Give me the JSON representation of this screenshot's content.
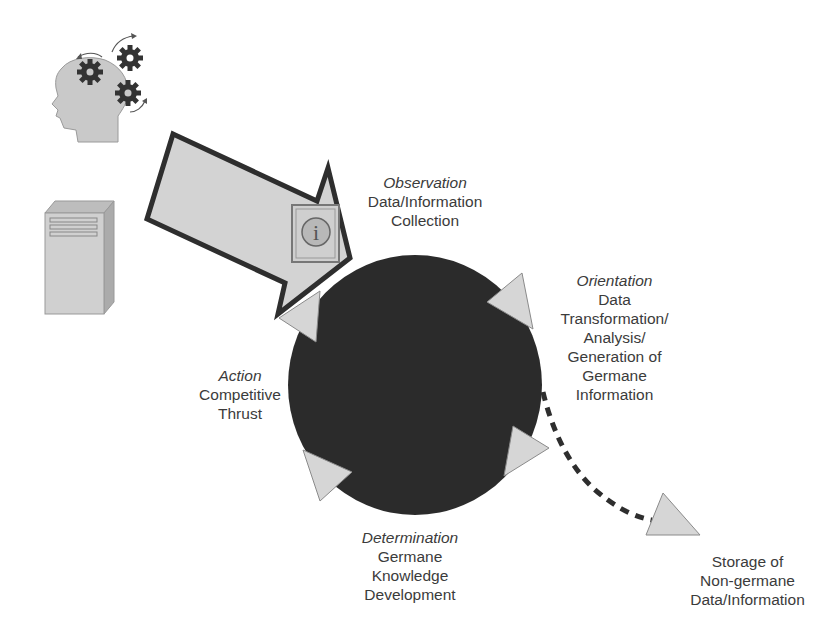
{
  "diagram": {
    "type": "OODA-style cycle: Observation → Orientation → Determination → Action",
    "inputs": [
      {
        "name": "human-knowledge",
        "icon": "head-with-gears-icon"
      },
      {
        "name": "computer-system",
        "icon": "server-tower-icon"
      }
    ],
    "input_arrow_icon": "information-icon",
    "info_glyph": "i",
    "stages": {
      "observation": {
        "title": "Observation",
        "lines": [
          "Data/Information",
          "Collection"
        ]
      },
      "orientation": {
        "title": "Orientation",
        "lines": [
          "Data",
          "Transformation/",
          "Analysis/",
          "Generation of",
          "Germane",
          "Information"
        ]
      },
      "determination": {
        "title": "Determination",
        "lines": [
          "Germane",
          "Knowledge",
          "Development"
        ]
      },
      "action": {
        "title": "Action",
        "lines": [
          "Competitive",
          "Thrust"
        ]
      }
    },
    "output": {
      "lines": [
        "Storage of",
        "Non-germane",
        "Data/Information"
      ],
      "connector": "dashed-curve"
    },
    "colors": {
      "circle": "#2b2b2b",
      "arrowhead_fill": "#d6d6d6",
      "arrow_outline": "#2e2e2e",
      "shape_fill": "#d2d2d2",
      "text": "#3b3b3b"
    }
  }
}
